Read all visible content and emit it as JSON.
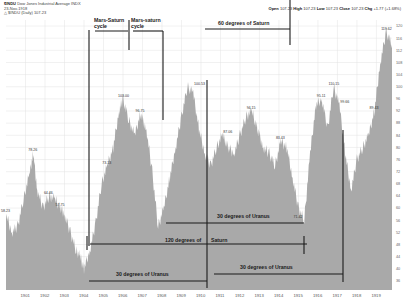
{
  "header": {
    "symbol": "$INDU",
    "name": "Dow Jones Industrial Average INDX",
    "line2": "23-Nov-1918",
    "line3": "△ $INDU (Daily) 107.23"
  },
  "quote": {
    "open_label": "Open",
    "open": "107.23",
    "high_label": "High",
    "high": "107.23",
    "low_label": "Low",
    "low": "107.23",
    "close_label": "Close",
    "close": "107.23",
    "chg_label": "Chg",
    "chg": "+1.77 (+1.68%)"
  },
  "colors": {
    "area": "#a9a9a9",
    "grid": "#e3e3e3",
    "annotation": "#1a1a1a",
    "background": "#ffffff"
  },
  "annotations": {
    "mars_saturn_1": [
      "Mars-Saturn",
      "cycle"
    ],
    "mars_saturn_2": [
      "Mars-saturn",
      "cycle"
    ],
    "saturn_60": "60 degrees of Saturn",
    "uranus_30_upper": "30 degrees of Uranus",
    "saturn_120_a": "120 degrees of",
    "saturn_120_b": "Saturn",
    "uranus_30_lower_left": "30 degrees of Uranus",
    "uranus_30_lower_right": "30 degrees of Uranus"
  },
  "chart_data": {
    "type": "area",
    "title": "$INDU Dow Jones Industrial Average INDX",
    "xlabel": "",
    "ylabel": "",
    "x_ticks": [
      "1901",
      "1902",
      "1903",
      "1904",
      "1905",
      "1906",
      "1907",
      "1908",
      "1909",
      "1910",
      "1911",
      "1912",
      "1913",
      "1914",
      "1915",
      "1916",
      "1917",
      "1918",
      "1919"
    ],
    "y_ticks": [
      120,
      116,
      112,
      108,
      104,
      100,
      96,
      92,
      88,
      84,
      80,
      76,
      72,
      68,
      64,
      60,
      56,
      52,
      48,
      44,
      40,
      36
    ],
    "ylim": [
      33,
      122
    ],
    "grid": true,
    "legend": "none",
    "series": [
      {
        "name": "$INDU close",
        "x": [
          1900.0,
          1900.3,
          1900.6,
          1900.9,
          1901.2,
          1901.4,
          1901.6,
          1901.9,
          1902.2,
          1902.5,
          1902.8,
          1903.0,
          1903.3,
          1903.6,
          1903.8,
          1904.0,
          1904.3,
          1904.6,
          1904.9,
          1905.2,
          1905.5,
          1905.8,
          1906.0,
          1906.3,
          1906.6,
          1906.9,
          1907.2,
          1907.5,
          1907.8,
          1908.1,
          1908.4,
          1908.7,
          1909.0,
          1909.3,
          1909.6,
          1909.9,
          1910.2,
          1910.5,
          1910.8,
          1911.1,
          1911.4,
          1911.7,
          1912.0,
          1912.3,
          1912.6,
          1912.9,
          1913.2,
          1913.5,
          1913.8,
          1914.1,
          1914.4,
          1914.7,
          1915.0,
          1915.3,
          1915.6,
          1915.9,
          1916.2,
          1916.5,
          1916.8,
          1917.1,
          1917.4,
          1917.7,
          1918.0,
          1918.3,
          1918.6,
          1918.9,
          1919.2,
          1919.5,
          1919.8
        ],
        "values": [
          58,
          52,
          54,
          63,
          71,
          78,
          66,
          60,
          64,
          63,
          60,
          58,
          52,
          46,
          44,
          40,
          46,
          55,
          68,
          74,
          80,
          92,
          96,
          89,
          84,
          91,
          86,
          72,
          54,
          60,
          70,
          80,
          90,
          100,
          98,
          86,
          78,
          74,
          80,
          84,
          80,
          78,
          84,
          90,
          92,
          86,
          80,
          78,
          74,
          82,
          80,
          70,
          60,
          56,
          78,
          94,
          96,
          86,
          100,
          94,
          78,
          66,
          76,
          80,
          84,
          92,
          108,
          118,
          114
        ]
      }
    ],
    "peak_labels": [
      {
        "x": 1900.0,
        "y": 58,
        "label": "58.23"
      },
      {
        "x": 1901.4,
        "y": 78,
        "label": "78.26"
      },
      {
        "x": 1902.2,
        "y": 64,
        "label": "64.46"
      },
      {
        "x": 1902.8,
        "y": 60,
        "label": "57.75"
      },
      {
        "x": 1905.2,
        "y": 74,
        "label": "73.13"
      },
      {
        "x": 1906.0,
        "y": 96,
        "label": "103.00"
      },
      {
        "x": 1906.9,
        "y": 91,
        "label": "96.75"
      },
      {
        "x": 1909.9,
        "y": 100,
        "label": "100.53"
      },
      {
        "x": 1911.4,
        "y": 84,
        "label": "87.06"
      },
      {
        "x": 1912.6,
        "y": 92,
        "label": "94.15"
      },
      {
        "x": 1914.1,
        "y": 82,
        "label": "83.43"
      },
      {
        "x": 1915.0,
        "y": 56,
        "label": "71.42"
      },
      {
        "x": 1916.2,
        "y": 96,
        "label": "95.11"
      },
      {
        "x": 1916.8,
        "y": 100,
        "label": "110.15"
      },
      {
        "x": 1917.4,
        "y": 94,
        "label": "99.66"
      },
      {
        "x": 1918.9,
        "y": 92,
        "label": "89.43"
      },
      {
        "x": 1919.5,
        "y": 118,
        "label": "119.62"
      }
    ]
  }
}
